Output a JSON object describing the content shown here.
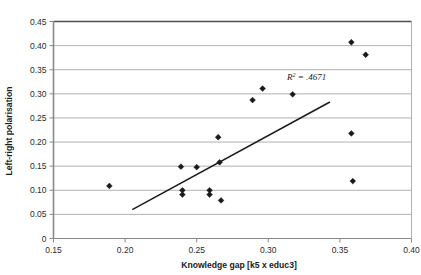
{
  "chart_data": {
    "type": "scatter",
    "title": "",
    "xlabel": "Knowledge gap [k5 x educ3]",
    "ylabel": "Left-right polarisation",
    "xlim": [
      0.15,
      0.4
    ],
    "ylim": [
      0,
      0.45
    ],
    "xticks": [
      "0.15",
      "0.20",
      "0.25",
      "0.30",
      "0.35",
      "0.40"
    ],
    "xtick_values": [
      0.15,
      0.2,
      0.25,
      0.3,
      0.35,
      0.4
    ],
    "yticks": [
      "0",
      "0.05",
      "0.10",
      "0.15",
      "0.20",
      "0.25",
      "0.30",
      "0.35",
      "0.40",
      "0.45"
    ],
    "ytick_values": [
      0,
      0.05,
      0.1,
      0.15,
      0.2,
      0.25,
      0.3,
      0.35,
      0.4,
      0.45
    ],
    "grid": "horizontal",
    "legend": "none",
    "marker": "diamond",
    "marker_color": "#1a1a1a",
    "trendline_color": "#1a1a1a",
    "points": [
      {
        "x": 0.189,
        "y": 0.109
      },
      {
        "x": 0.239,
        "y": 0.149
      },
      {
        "x": 0.24,
        "y": 0.1
      },
      {
        "x": 0.24,
        "y": 0.091
      },
      {
        "x": 0.25,
        "y": 0.148
      },
      {
        "x": 0.259,
        "y": 0.1
      },
      {
        "x": 0.259,
        "y": 0.091
      },
      {
        "x": 0.265,
        "y": 0.21
      },
      {
        "x": 0.266,
        "y": 0.158
      },
      {
        "x": 0.267,
        "y": 0.079
      },
      {
        "x": 0.289,
        "y": 0.287
      },
      {
        "x": 0.296,
        "y": 0.311
      },
      {
        "x": 0.317,
        "y": 0.299
      },
      {
        "x": 0.358,
        "y": 0.407
      },
      {
        "x": 0.368,
        "y": 0.381
      },
      {
        "x": 0.358,
        "y": 0.218
      },
      {
        "x": 0.359,
        "y": 0.119
      }
    ],
    "trendline": {
      "x1": 0.205,
      "y1": 0.06,
      "x2": 0.343,
      "y2": 0.283
    },
    "annotations": [
      {
        "text_prefix": "R",
        "text_sup": "2",
        "text_suffix": " = .4671",
        "x": 0.313,
        "y": 0.328
      }
    ]
  }
}
